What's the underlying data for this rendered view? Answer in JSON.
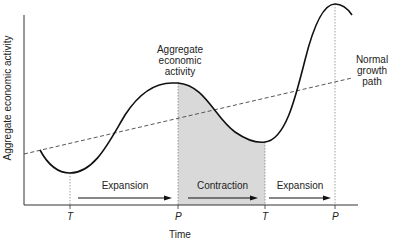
{
  "diagram": {
    "y_axis_label": "Aggregate economic activity",
    "x_axis_label": "Time",
    "curve_label": [
      "Aggregate",
      "economic",
      "activity"
    ],
    "trend_label": [
      "Normal",
      "growth",
      "path"
    ],
    "ticks": [
      {
        "label": "T",
        "x": 70
      },
      {
        "label": "P",
        "x": 178
      },
      {
        "label": "T",
        "x": 265
      },
      {
        "label": "P",
        "x": 335
      }
    ],
    "phases": [
      {
        "label": "Expansion",
        "from": "T",
        "to": "P"
      },
      {
        "label": "Contraction",
        "from": "P",
        "to": "T",
        "shaded": true
      },
      {
        "label": "Expansion",
        "from": "T",
        "to": "P"
      }
    ],
    "colors": {
      "curve": "#111111",
      "shade": "#d9d9d9",
      "axis": "#333333",
      "dashed": "#444444"
    }
  }
}
